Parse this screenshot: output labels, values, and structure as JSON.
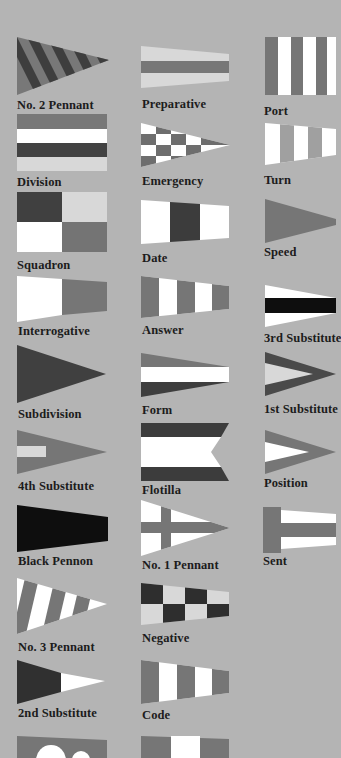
{
  "colors": {
    "background": "#b4b4b4",
    "dark": "#3c3c3c",
    "mid": "#767676",
    "light": "#d8d8d8",
    "white": "#ffffff",
    "black": "#0e0e0e"
  },
  "flags": [
    {
      "id": "no-2-pennant",
      "label": "No. 2 Pennant",
      "column": 1
    },
    {
      "id": "division",
      "label": "Division",
      "column": 1
    },
    {
      "id": "squadron",
      "label": "Squadron",
      "column": 1
    },
    {
      "id": "interrogative",
      "label": "Interrogative",
      "column": 1
    },
    {
      "id": "subdivision",
      "label": "Subdivision",
      "column": 1
    },
    {
      "id": "4th-substitute",
      "label": "4th Substitute",
      "column": 1
    },
    {
      "id": "black-pennon",
      "label": "Black Pennon",
      "column": 1
    },
    {
      "id": "no-3-pennant",
      "label": "No. 3 Pennant",
      "column": 1
    },
    {
      "id": "2nd-substitute",
      "label": "2nd Substitute",
      "column": 1
    },
    {
      "id": "partial-flag-col1",
      "label": "",
      "column": 1
    },
    {
      "id": "preparative",
      "label": "Preparative",
      "column": 2
    },
    {
      "id": "emergency",
      "label": "Emergency",
      "column": 2
    },
    {
      "id": "date",
      "label": "Date",
      "column": 2
    },
    {
      "id": "answer",
      "label": "Answer",
      "column": 2
    },
    {
      "id": "form",
      "label": "Form",
      "column": 2
    },
    {
      "id": "flotilla",
      "label": "Flotilla",
      "column": 2
    },
    {
      "id": "no-1-pennant",
      "label": "No. 1 Pennant",
      "column": 2
    },
    {
      "id": "negative",
      "label": "Negative",
      "column": 2
    },
    {
      "id": "code",
      "label": "Code",
      "column": 2
    },
    {
      "id": "partial-flag-col2",
      "label": "",
      "column": 2
    },
    {
      "id": "port",
      "label": "Port",
      "column": 3
    },
    {
      "id": "turn",
      "label": "Turn",
      "column": 3
    },
    {
      "id": "speed",
      "label": "Speed",
      "column": 3
    },
    {
      "id": "3rd-substitute",
      "label": "3rd Substitute",
      "column": 3
    },
    {
      "id": "1st-substitute",
      "label": "1st Substitute",
      "column": 3
    },
    {
      "id": "position",
      "label": "Position",
      "column": 3
    },
    {
      "id": "sent",
      "label": "Sent",
      "column": 3
    }
  ]
}
